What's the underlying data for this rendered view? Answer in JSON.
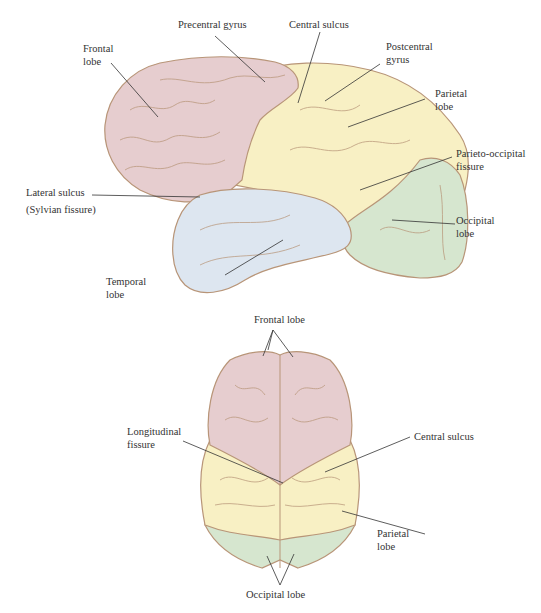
{
  "figure": {
    "lateral_view": {
      "labels": {
        "frontal_lobe": [
          "Frontal",
          "lobe"
        ],
        "precentral_gyrus": [
          "Precentral gyrus"
        ],
        "central_sulcus": [
          "Central sulcus"
        ],
        "postcentral_gyrus": [
          "Postcentral",
          "gyrus"
        ],
        "parietal_lobe": [
          "Parietal",
          "lobe"
        ],
        "parieto_occipital_fissure": [
          "Parieto-occipital",
          "fissure"
        ],
        "occipital_lobe": [
          "Occipital",
          "lobe"
        ],
        "lateral_sulcus": [
          "Lateral sulcus",
          "(Sylvian fissure)"
        ],
        "temporal_lobe": [
          "Temporal",
          "lobe"
        ]
      }
    },
    "superior_view": {
      "labels": {
        "frontal_lobe": [
          "Frontal lobe"
        ],
        "longitudinal_fissure": [
          "Longitudinal",
          "fissure"
        ],
        "central_sulcus": [
          "Central sulcus"
        ],
        "parietal_lobe": [
          "Parietal",
          "lobe"
        ],
        "occipital_lobe": [
          "Occipital lobe"
        ]
      }
    }
  },
  "colors": {
    "frontal": "#e6cdcf",
    "parietal": "#f8f0c4",
    "temporal": "#dde6f0",
    "occipital": "#d6e6cf",
    "outline": "#b89578",
    "leader_line": "#333333"
  }
}
